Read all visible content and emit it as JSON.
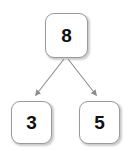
{
  "diagram": {
    "type": "binary-tree",
    "title": "",
    "background_color": "#ffffff",
    "node_fill": "#ffffff",
    "node_border_color": "#9a9a9a",
    "edge_color": "#8c8c8c",
    "label_color": "#111111",
    "nodes": [
      {
        "id": "root",
        "label": "8",
        "role": "parent"
      },
      {
        "id": "left",
        "label": "3",
        "role": "left-child"
      },
      {
        "id": "right",
        "label": "5",
        "role": "right-child"
      }
    ],
    "edges": [
      {
        "from": "8",
        "to": "3",
        "arrow": "arrowhead-filled"
      },
      {
        "from": "8",
        "to": "5",
        "arrow": "arrowhead-filled"
      }
    ]
  }
}
